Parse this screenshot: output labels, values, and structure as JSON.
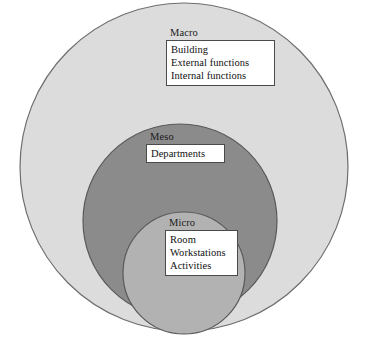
{
  "diagram": {
    "type": "nested-venn",
    "background_color": "#ffffff",
    "levels": [
      {
        "id": "macro",
        "label": "Macro",
        "fill_color": "#dcdcdc",
        "stroke_color": "#6e6e6e",
        "items": [
          "Building",
          "External functions",
          "Internal functions"
        ]
      },
      {
        "id": "meso",
        "label": "Meso",
        "fill_color": "#8b8b8b",
        "stroke_color": "#5a5a5a",
        "items": [
          "Departments"
        ]
      },
      {
        "id": "micro",
        "label": "Micro",
        "fill_color": "#b2b2b2",
        "stroke_color": "#5a5a5a",
        "items": [
          "Room",
          "Workstations",
          "Activities"
        ]
      }
    ],
    "box_border_color": "#4a4a4a",
    "box_fill_color": "#ffffff",
    "text_color": "#111111"
  }
}
